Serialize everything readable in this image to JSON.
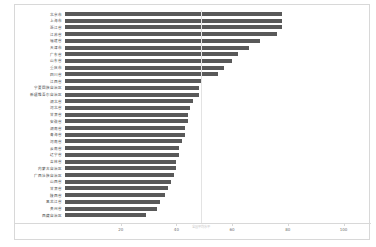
{
  "chart_data": {
    "type": "bar",
    "orientation": "horizontal",
    "title": "",
    "xlabel": "",
    "ylabel": "",
    "xlim": [
      0,
      107
    ],
    "xticks": [
      20,
      40,
      60,
      80,
      100
    ],
    "grid": false,
    "categories": [
      "北京市",
      "上海市",
      "浙江省",
      "江苏省",
      "福建省",
      "天津市",
      "广东省",
      "山东省",
      "重庆市",
      "四川省",
      "江西省",
      "宁夏回族自治区",
      "新疆维吾尔自治区",
      "湖北省",
      "河北省",
      "甘肃省",
      "安徽省",
      "湖南省",
      "青海省",
      "河南省",
      "云南省",
      "辽宁省",
      "吉林省",
      "内蒙古自治区",
      "广西壮族自治区",
      "山西省",
      "甘肃省",
      "陕西省",
      "黑龙江省",
      "贵州省",
      "西藏自治区"
    ],
    "values": [
      78,
      78,
      78,
      76,
      70,
      66,
      62,
      60,
      57,
      55,
      49,
      48,
      48,
      46,
      45,
      44,
      44,
      43,
      43,
      42,
      41,
      41,
      40,
      40,
      39,
      38,
      37,
      36,
      34,
      33,
      29
    ],
    "reference_line": {
      "value": 49,
      "label": "全国平均水平"
    },
    "bar_color": "#595959",
    "series_name": ""
  }
}
